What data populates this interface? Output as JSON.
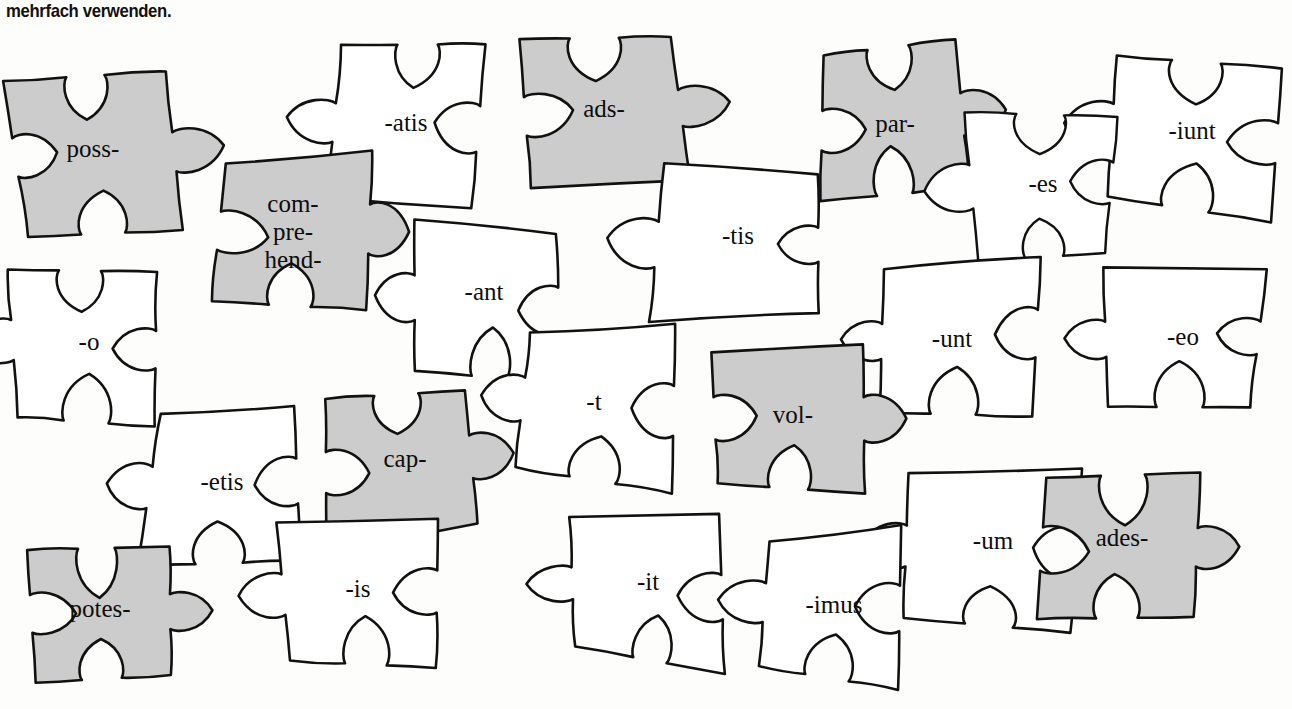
{
  "header": {
    "text": "mehrfach verwenden."
  },
  "colors": {
    "background": "#fdfdfb",
    "stroke": "#111111",
    "shaded_fill": "#cccccc",
    "plain_fill": "#ffffff",
    "text": "#0d0d0d"
  },
  "puzzle": {
    "type": "jigsaw-word-pieces",
    "piece_count": 20,
    "shaded_meaning": "verb stem",
    "plain_meaning": "verb ending",
    "pieces": [
      {
        "id": "piece-poss",
        "label": "poss-",
        "lines": [
          "poss-"
        ],
        "shaded": true,
        "cx": 93,
        "cy": 151,
        "rot": -4,
        "scale": 1.0
      },
      {
        "id": "piece-atis",
        "label": "-atis",
        "lines": [
          "-atis"
        ],
        "shaded": false,
        "cx": 406,
        "cy": 125,
        "rot": 4,
        "scale": 1.0
      },
      {
        "id": "piece-ads",
        "label": "ads-",
        "lines": [
          "ads-"
        ],
        "shaded": true,
        "cx": 604,
        "cy": 111,
        "rot": -2,
        "scale": 1.0
      },
      {
        "id": "piece-par",
        "label": "par-",
        "lines": [
          "par-"
        ],
        "shaded": true,
        "cx": 895,
        "cy": 126,
        "rot": -3,
        "scale": 1.0
      },
      {
        "id": "piece-iunt",
        "label": "-iunt",
        "lines": [
          "-iunt"
        ],
        "shaded": false,
        "cx": 1192,
        "cy": 133,
        "rot": 3,
        "scale": 1.0
      },
      {
        "id": "piece-comprehend",
        "label": "com-pre-hend-",
        "lines": [
          "com-",
          "pre-",
          "hend-"
        ],
        "shaded": true,
        "cx": 293,
        "cy": 234,
        "rot": -2,
        "scale": 1.0
      },
      {
        "id": "piece-tis",
        "label": "-tis",
        "lines": [
          "-tis"
        ],
        "shaded": false,
        "cx": 738,
        "cy": 238,
        "rot": 2,
        "scale": 1.0
      },
      {
        "id": "piece-es",
        "label": "-es",
        "lines": [
          "-es"
        ],
        "shaded": false,
        "cx": 1043,
        "cy": 186,
        "rot": 4,
        "scale": 0.95
      },
      {
        "id": "piece-ant",
        "label": "-ant",
        "lines": [
          "-ant"
        ],
        "shaded": false,
        "cx": 484,
        "cy": 294,
        "rot": 3,
        "scale": 1.0
      },
      {
        "id": "piece-o",
        "label": "-o",
        "lines": [
          "-o"
        ],
        "shaded": false,
        "cx": 89,
        "cy": 344,
        "rot": 3,
        "scale": 1.0
      },
      {
        "id": "piece-unt",
        "label": "-unt",
        "lines": [
          "-unt"
        ],
        "shaded": false,
        "cx": 952,
        "cy": 341,
        "rot": 2,
        "scale": 1.0
      },
      {
        "id": "piece-eo",
        "label": "-eo",
        "lines": [
          "-eo"
        ],
        "shaded": false,
        "cx": 1183,
        "cy": 339,
        "rot": 2,
        "scale": 1.0
      },
      {
        "id": "piece-t",
        "label": "-t",
        "lines": [
          "-t"
        ],
        "shaded": false,
        "cx": 594,
        "cy": 404,
        "rot": 3,
        "scale": 1.0
      },
      {
        "id": "piece-vol",
        "label": "vol-",
        "lines": [
          "vol-"
        ],
        "shaded": true,
        "cx": 793,
        "cy": 417,
        "rot": -2,
        "scale": 1.0
      },
      {
        "id": "piece-etis",
        "label": "-etis",
        "lines": [
          "-etis"
        ],
        "shaded": false,
        "cx": 222,
        "cy": 484,
        "rot": 3,
        "scale": 1.0
      },
      {
        "id": "piece-cap",
        "label": "cap-",
        "lines": [
          "cap-"
        ],
        "shaded": true,
        "cx": 405,
        "cy": 461,
        "rot": -3,
        "scale": 1.0
      },
      {
        "id": "piece-um",
        "label": "-um",
        "lines": [
          "-um"
        ],
        "shaded": false,
        "cx": 993,
        "cy": 543,
        "rot": 3,
        "scale": 1.0
      },
      {
        "id": "piece-ades",
        "label": "ades-",
        "lines": [
          "ades-"
        ],
        "shaded": true,
        "cx": 1122,
        "cy": 540,
        "rot": -2,
        "scale": 1.0
      },
      {
        "id": "piece-is",
        "label": "-is",
        "lines": [
          "-is"
        ],
        "shaded": false,
        "cx": 358,
        "cy": 591,
        "rot": 3,
        "scale": 1.0
      },
      {
        "id": "piece-potes",
        "label": "potes-",
        "lines": [
          "potes-"
        ],
        "shaded": true,
        "cx": 100,
        "cy": 611,
        "rot": -2,
        "scale": 1.0
      },
      {
        "id": "piece-it",
        "label": "-it",
        "lines": [
          "-it"
        ],
        "shaded": false,
        "cx": 648,
        "cy": 584,
        "rot": 3,
        "scale": 1.0
      },
      {
        "id": "piece-imus",
        "label": "-imus",
        "lines": [
          "-imus"
        ],
        "shaded": false,
        "cx": 834,
        "cy": 607,
        "rot": 3,
        "scale": 1.0
      }
    ]
  }
}
